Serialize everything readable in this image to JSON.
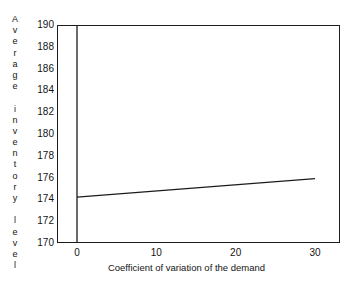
{
  "chart_data": {
    "type": "line",
    "title": "",
    "subtitle": "",
    "xlabel": "Coefficient of variation of the demand",
    "ylabel": "Average inventory level",
    "xlim": [
      -3,
      32.5
    ],
    "ylim": [
      170,
      190
    ],
    "xticks": [
      0,
      10,
      20,
      30
    ],
    "xticklabels": [
      "0",
      "10",
      "20",
      "30"
    ],
    "yticks": [
      170,
      172,
      174,
      176,
      178,
      180,
      182,
      184,
      186,
      188,
      190
    ],
    "yticklabels": [
      "170",
      "172",
      "174",
      "176",
      "178",
      "180",
      "182",
      "184",
      "186",
      "188",
      "190"
    ],
    "grid": false,
    "legend": false,
    "legend_position": "none",
    "axis_zero_line": {
      "axis": "x",
      "value": 0,
      "visible": true
    },
    "series": [
      {
        "name": "Average inventory level",
        "color": "#1c1c1c",
        "linewidth": 1.2,
        "marker": "none",
        "x": [
          0,
          30
        ],
        "y": [
          174.2,
          175.9
        ]
      }
    ],
    "annotations": []
  },
  "axis_labels": {
    "y_label_letters": [
      "A",
      "v",
      "e",
      "r",
      "a",
      "g",
      "e",
      "",
      "i",
      "n",
      "v",
      "e",
      "n",
      "t",
      "o",
      "r",
      "y",
      "",
      "l",
      "e",
      "v",
      "e",
      "l"
    ]
  },
  "colors": {
    "background": "#ffffff",
    "axis": "#1c1c1c",
    "text": "#141414",
    "line": "#1c1c1c"
  }
}
